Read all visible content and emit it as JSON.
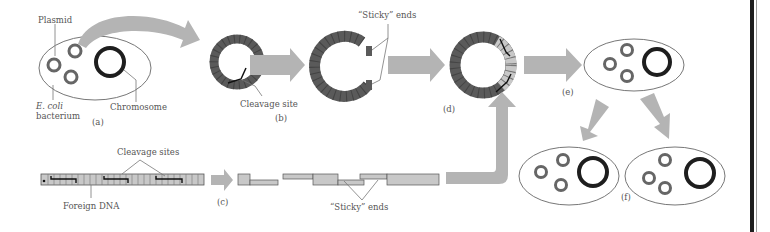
{
  "figure": {
    "colors": {
      "arrow": "#b4b4b4",
      "plasmid_dna": "#5a5a5a",
      "foreign_dna": "#c8c8c8",
      "chromosome": "#1e1e1e",
      "outline": "#777777",
      "text": "#555555"
    },
    "panels": {
      "a": "(a)",
      "b": "(b)",
      "c": "(c)",
      "d": "(d)",
      "e": "(e)",
      "f": "(f)"
    },
    "labels": {
      "plasmid": "Plasmid",
      "ecoli": "E. coli",
      "bacterium": "bacterium",
      "chromosome": "Chromosome",
      "cleavage_site": "Cleavage site",
      "sticky_ends_top": "“Sticky” ends",
      "cleavage_sites": "Cleavage sites",
      "foreign_dna": "Foreign DNA",
      "sticky_ends_bottom": "“Sticky” ends"
    }
  }
}
